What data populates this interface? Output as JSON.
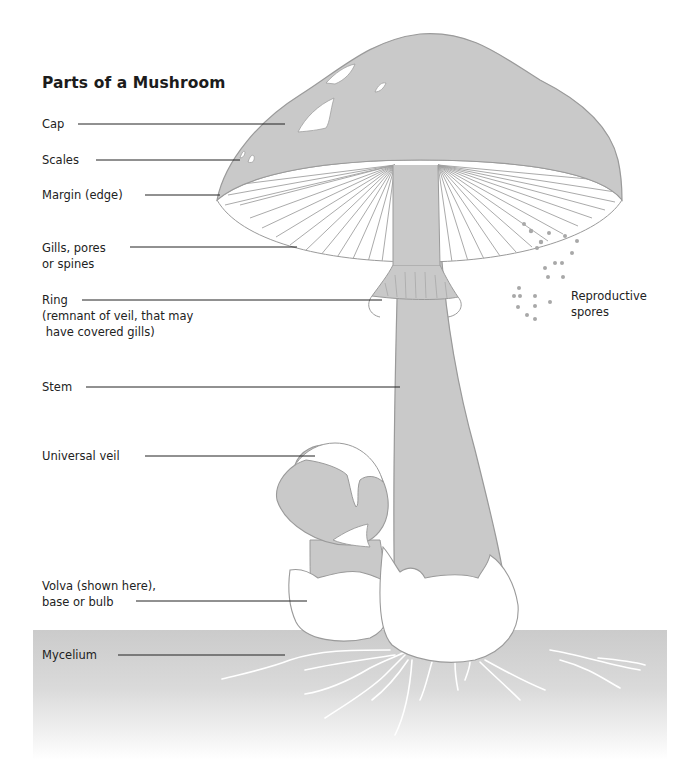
{
  "title": "Parts of a Mushroom",
  "labels": {
    "cap": "Cap",
    "scales": "Scales",
    "margin": "Margin (edge)",
    "gills": "Gills, pores\nor spines",
    "ring": "Ring\n(remnant of veil, that may\n have covered gills)",
    "stem": "Stem",
    "universal_veil": "Universal veil",
    "volva": "Volva (shown here),\nbase or bulb",
    "mycelium": "Mycelium",
    "spores": "Reproductive\nspores"
  },
  "colors": {
    "fill": "#c9c9c9",
    "outline": "#9a9a9a",
    "leader": "#222222",
    "ground_top": "#cfcfcf",
    "text": "#1c1c1c"
  }
}
